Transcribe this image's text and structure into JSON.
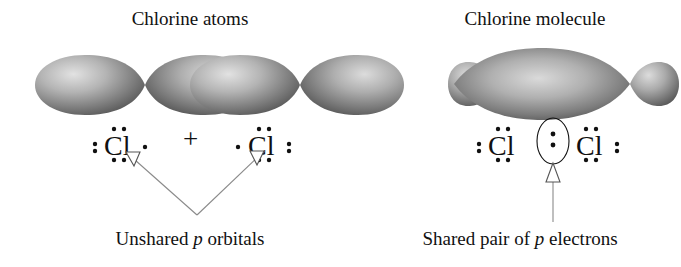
{
  "figure": {
    "width": 681,
    "height": 267,
    "background": "#ffffff",
    "ink_color": "#111111",
    "orbital_fill_dark": "#4a4a4a",
    "orbital_fill_light": "#d8d8d8",
    "annotation_line_color": "#8a8a8a"
  },
  "left_panel": {
    "title": "Chlorine atoms",
    "caption_prefix": "Unshared ",
    "caption_italic": "p",
    "caption_suffix": " orbitals",
    "operator": "+",
    "atoms": [
      {
        "element": "Cl",
        "dots_left": 2,
        "dots_top": 2,
        "dots_bottom": 2,
        "dots_right": 1,
        "valence_electrons": 7,
        "orbital_type": "p",
        "lobes": 2
      },
      {
        "element": "Cl",
        "dots_left": 1,
        "dots_top": 2,
        "dots_bottom": 2,
        "dots_right": 2,
        "valence_electrons": 7,
        "orbital_type": "p",
        "lobes": 2
      }
    ]
  },
  "right_panel": {
    "title": "Chlorine molecule",
    "caption_prefix": "Shared pair of ",
    "caption_italic": "p",
    "caption_suffix": " electrons",
    "molecule": {
      "formula": "Cl2",
      "left_atom": {
        "element": "Cl",
        "dots_left": 2,
        "dots_top": 2,
        "dots_bottom": 2,
        "dots_right": 0
      },
      "right_atom": {
        "element": "Cl",
        "dots_left": 0,
        "dots_top": 2,
        "dots_bottom": 2,
        "dots_right": 2
      },
      "shared_pair": {
        "electrons": 2,
        "highlight_shape": "ellipse"
      },
      "orbital_description": "two small outer lobes with one large central overlap lobe"
    }
  },
  "annotations": [
    {
      "name": "unshared-p-orbitals-pointer",
      "style": "double-headed-v",
      "arrowheads": 2,
      "target": "unshared p orbital lobes of both chlorine atoms"
    },
    {
      "name": "shared-pair-pointer",
      "style": "single-arrow-up",
      "arrowheads": 1,
      "target": "shared electron pair ellipse"
    }
  ]
}
